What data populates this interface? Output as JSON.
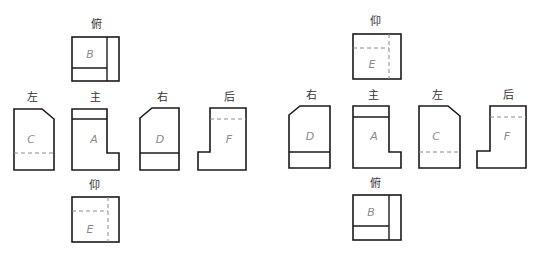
{
  "diagram": {
    "panels": [
      {
        "id": "left-panel",
        "views": [
          {
            "id": "top",
            "label": "俯",
            "letter": "B"
          },
          {
            "id": "left",
            "label": "左",
            "letter": "C"
          },
          {
            "id": "front",
            "label": "主",
            "letter": "A"
          },
          {
            "id": "right",
            "label": "右",
            "letter": "D"
          },
          {
            "id": "rear",
            "label": "后",
            "letter": "F"
          },
          {
            "id": "bottom",
            "label": "仰",
            "letter": "E"
          }
        ]
      },
      {
        "id": "right-panel",
        "views": [
          {
            "id": "bottom",
            "label": "仰",
            "letter": "E"
          },
          {
            "id": "right",
            "label": "右",
            "letter": "D"
          },
          {
            "id": "front",
            "label": "主",
            "letter": "A"
          },
          {
            "id": "left",
            "label": "左",
            "letter": "C"
          },
          {
            "id": "rear",
            "label": "后",
            "letter": "F"
          },
          {
            "id": "top",
            "label": "俯",
            "letter": "B"
          }
        ]
      }
    ]
  }
}
